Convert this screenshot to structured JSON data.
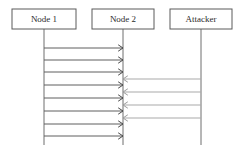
{
  "diagram": {
    "type": "sequence-diagram",
    "width": 242,
    "height": 153,
    "background_color": "#ffffff",
    "line_color": "#5f5f5f",
    "faint_line_color": "#a9a9a9",
    "box_border_color": "#5a5a5a",
    "text_color": "#2b2b2b",
    "actors": [
      {
        "id": "node-1",
        "label": "Node 1",
        "box": {
          "x": 12,
          "y": 9,
          "width": 64,
          "height": 20
        },
        "lifeline_x": 44,
        "lifeline_y_start": 29,
        "lifeline_y_end": 145
      },
      {
        "id": "node-2",
        "label": "Node 2",
        "box": {
          "x": 92,
          "y": 9,
          "width": 62,
          "height": 20
        },
        "lifeline_x": 123,
        "lifeline_y_start": 29,
        "lifeline_y_end": 145
      },
      {
        "id": "attacker",
        "label": "Attacker",
        "box": {
          "x": 170,
          "y": 9,
          "width": 62,
          "height": 20
        },
        "lifeline_x": 201,
        "lifeline_y_start": 29,
        "lifeline_y_end": 145
      }
    ],
    "messages": [
      {
        "id": "m1",
        "from": "node-1",
        "to": "node-2",
        "direction": "right",
        "y": 48,
        "x_start": 44,
        "x_end": 123,
        "emphasis": "strong",
        "label": ""
      },
      {
        "id": "m2",
        "from": "node-1",
        "to": "node-2",
        "direction": "right",
        "y": 60,
        "x_start": 44,
        "x_end": 123,
        "emphasis": "strong",
        "label": ""
      },
      {
        "id": "m3",
        "from": "node-1",
        "to": "node-2",
        "direction": "right",
        "y": 72,
        "x_start": 44,
        "x_end": 123,
        "emphasis": "strong",
        "label": ""
      },
      {
        "id": "a1",
        "from": "attacker",
        "to": "node-2",
        "direction": "left",
        "y": 79,
        "x_start": 201,
        "x_end": 123,
        "emphasis": "faint",
        "label": ""
      },
      {
        "id": "m4",
        "from": "node-1",
        "to": "node-2",
        "direction": "right",
        "y": 85,
        "x_start": 44,
        "x_end": 123,
        "emphasis": "strong",
        "label": ""
      },
      {
        "id": "a2",
        "from": "attacker",
        "to": "node-2",
        "direction": "left",
        "y": 92,
        "x_start": 201,
        "x_end": 123,
        "emphasis": "faint",
        "label": ""
      },
      {
        "id": "m5",
        "from": "node-1",
        "to": "node-2",
        "direction": "right",
        "y": 98,
        "x_start": 44,
        "x_end": 123,
        "emphasis": "strong",
        "label": ""
      },
      {
        "id": "a3",
        "from": "attacker",
        "to": "node-2",
        "direction": "left",
        "y": 105,
        "x_start": 201,
        "x_end": 123,
        "emphasis": "faint",
        "label": ""
      },
      {
        "id": "m6",
        "from": "node-1",
        "to": "node-2",
        "direction": "right",
        "y": 111,
        "x_start": 44,
        "x_end": 123,
        "emphasis": "strong",
        "label": ""
      },
      {
        "id": "a4",
        "from": "attacker",
        "to": "node-2",
        "direction": "left",
        "y": 118,
        "x_start": 201,
        "x_end": 123,
        "emphasis": "faint",
        "label": ""
      },
      {
        "id": "m7",
        "from": "node-1",
        "to": "node-2",
        "direction": "right",
        "y": 124,
        "x_start": 44,
        "x_end": 123,
        "emphasis": "strong",
        "label": ""
      },
      {
        "id": "m8",
        "from": "node-1",
        "to": "node-2",
        "direction": "right",
        "y": 136,
        "x_start": 44,
        "x_end": 123,
        "emphasis": "strong",
        "label": ""
      }
    ],
    "counts": {
      "node1_to_node2_messages": 8,
      "attacker_to_node2_messages": 4,
      "total_messages": 12,
      "actors": 3
    }
  }
}
